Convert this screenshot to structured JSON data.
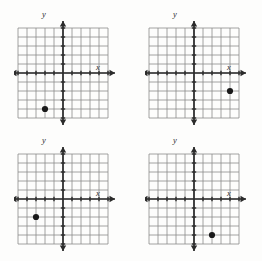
{
  "page": {
    "title_fragment": "",
    "background_color": "#fdfdfc",
    "ink_color": "#3a3a3a",
    "grid_color": "#8c8c8c",
    "axis_color": "#2b2b2b",
    "point_color": "#1a1a1a"
  },
  "axis_labels": {
    "x": "x",
    "y": "y"
  },
  "chart_data": [
    {
      "type": "scatter",
      "title": "",
      "xlabel": "x",
      "ylabel": "y",
      "xlim": [
        -5,
        5
      ],
      "ylim": [
        -5,
        5
      ],
      "grid": true,
      "legend": "none",
      "x": [
        -2
      ],
      "y": [
        -4
      ],
      "points": [
        {
          "x": -2,
          "y": -4
        }
      ]
    },
    {
      "type": "scatter",
      "title": "",
      "xlabel": "x",
      "ylabel": "y",
      "xlim": [
        -5,
        5
      ],
      "ylim": [
        -5,
        5
      ],
      "grid": true,
      "legend": "none",
      "x": [
        4
      ],
      "y": [
        -2
      ],
      "points": [
        {
          "x": 4,
          "y": -2
        }
      ]
    },
    {
      "type": "scatter",
      "title": "",
      "xlabel": "x",
      "ylabel": "y",
      "xlim": [
        -5,
        5
      ],
      "ylim": [
        -5,
        5
      ],
      "grid": true,
      "legend": "none",
      "x": [
        -3
      ],
      "y": [
        -2
      ],
      "points": [
        {
          "x": -3,
          "y": -2
        }
      ]
    },
    {
      "type": "scatter",
      "title": "",
      "xlabel": "x",
      "ylabel": "y",
      "xlim": [
        -5,
        5
      ],
      "ylim": [
        -5,
        5
      ],
      "grid": true,
      "legend": "none",
      "x": [
        2
      ],
      "y": [
        -4
      ],
      "points": [
        {
          "x": 2,
          "y": -4
        }
      ]
    }
  ]
}
